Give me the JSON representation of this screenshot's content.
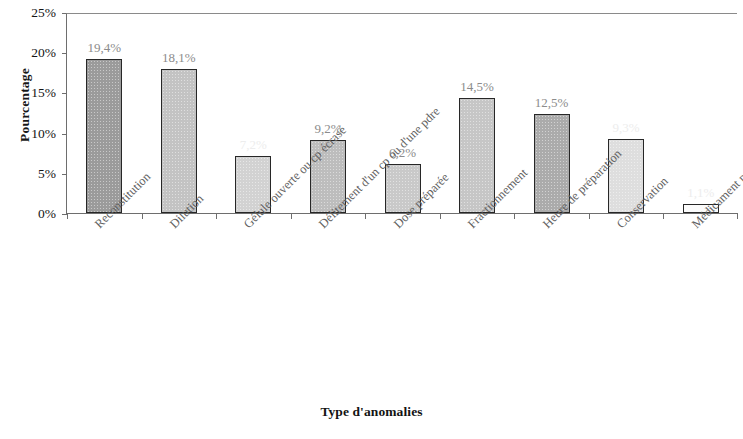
{
  "chart_data": {
    "type": "bar",
    "title": "",
    "xlabel": "Type d'anomalies",
    "ylabel": "Pourcentage",
    "ylim": [
      0,
      25
    ],
    "ytick_labels": [
      "0%",
      "5%",
      "10%",
      "15%",
      "20%",
      "25%"
    ],
    "ytick_values": [
      0,
      5,
      10,
      15,
      20,
      25
    ],
    "grid": false,
    "legend": "none",
    "categories": [
      "Reconstitution",
      "Dilution",
      "Gélule ouverte ou cp écrasé",
      "Délitement d'un cp ou d'une pdre",
      "Dose préparée",
      "Fractionnement",
      "Heure de préparation",
      "Conservation",
      "Médicament préparé"
    ],
    "values": [
      19.4,
      18.1,
      7.2,
      9.2,
      6.2,
      14.5,
      12.5,
      9.3,
      1.1
    ],
    "data_labels": [
      "19,4%",
      "18,1%",
      "7,2%",
      "9,2%",
      "6,2%",
      "14,5%",
      "12,5%",
      "9,3%",
      "1,1%"
    ],
    "label_visibility": [
      "strong",
      "strong",
      "faded",
      "strong",
      "strong",
      "strong",
      "strong",
      "faded",
      "faded"
    ],
    "bar_colors": [
      "#9b9b9b",
      "#c3c3c3",
      "#d2d2d2",
      "#bdbdbd",
      "#c9c9c9",
      "#c6c6c6",
      "#ababab",
      "#dedede",
      "#fbfbfb"
    ],
    "bar_edge_color": "#272727",
    "axis_color": "#6e6e6e"
  }
}
